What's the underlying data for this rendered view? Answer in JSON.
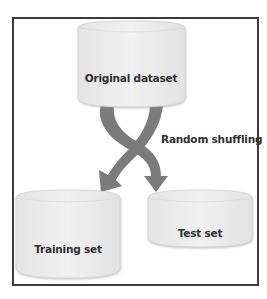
{
  "diagram": {
    "title": "",
    "nodes": [
      {
        "id": "original",
        "label": "Original dataset",
        "shape": "cylinder"
      },
      {
        "id": "training",
        "label": "Training set",
        "shape": "cylinder"
      },
      {
        "id": "test",
        "label": "Test set",
        "shape": "cylinder"
      }
    ],
    "edges": [
      {
        "from": "original",
        "to": "training",
        "style": "curved-arrow"
      },
      {
        "from": "original",
        "to": "test",
        "style": "curved-arrow"
      }
    ],
    "annotation": {
      "label": "Random shuffling"
    },
    "colors": {
      "frame": "#3c3c3c",
      "cylinder_fill": "#ececec",
      "cylinder_edge": "#d0d0d0",
      "arrow": "#7a7a7a",
      "text": "#2f2f2f"
    }
  }
}
